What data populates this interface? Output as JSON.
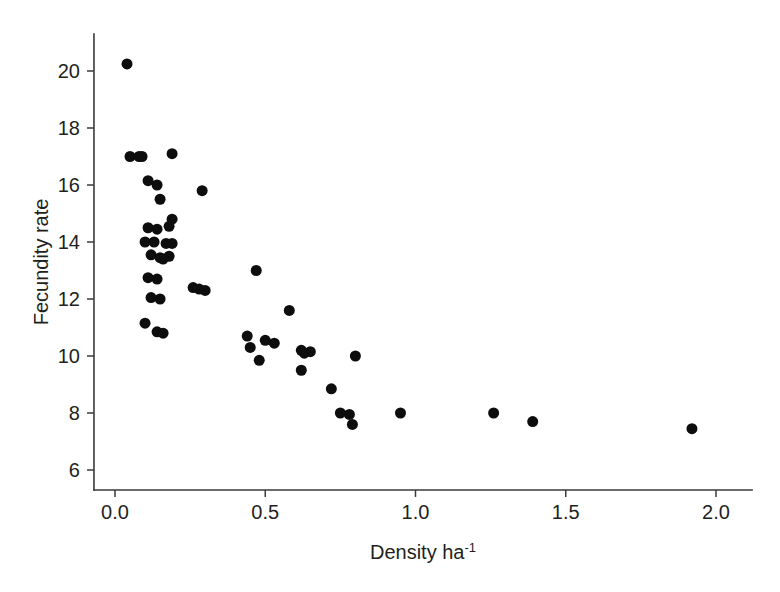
{
  "figure": {
    "background_color": "#ffffff",
    "caption_partial": ""
  },
  "chart_data": {
    "type": "scatter",
    "title": "",
    "subtitle": "",
    "xlabel_text": "Density ha",
    "xlabel_exponent": "-1",
    "xlabel": "Density ha-1",
    "ylabel": "Fecundity rate",
    "xlim": [
      -0.07,
      2.12
    ],
    "ylim": [
      5.3,
      21.3
    ],
    "xticks": [
      0.0,
      0.5,
      1.0,
      1.5,
      2.0
    ],
    "xticklabels": [
      "0.0",
      "0.5",
      "1.0",
      "1.5",
      "2.0"
    ],
    "yticks": [
      6,
      8,
      10,
      12,
      14,
      16,
      18,
      20
    ],
    "yticklabels": [
      "6",
      "8",
      "10",
      "12",
      "14",
      "16",
      "18",
      "20"
    ],
    "grid": false,
    "legend": false,
    "legend_position": "none",
    "marker": "filled-circle",
    "marker_color": "#0d0d0d",
    "marker_size_px": 11,
    "n_points": 54,
    "points": [
      [
        0.04,
        20.25
      ],
      [
        0.05,
        17.0
      ],
      [
        0.08,
        17.0
      ],
      [
        0.09,
        17.0
      ],
      [
        0.19,
        17.1
      ],
      [
        0.11,
        16.15
      ],
      [
        0.14,
        16.0
      ],
      [
        0.29,
        15.8
      ],
      [
        0.15,
        15.5
      ],
      [
        0.11,
        14.5
      ],
      [
        0.14,
        14.45
      ],
      [
        0.18,
        14.55
      ],
      [
        0.19,
        14.8
      ],
      [
        0.1,
        14.0
      ],
      [
        0.13,
        14.0
      ],
      [
        0.17,
        13.95
      ],
      [
        0.19,
        13.95
      ],
      [
        0.12,
        13.55
      ],
      [
        0.15,
        13.45
      ],
      [
        0.18,
        13.5
      ],
      [
        0.16,
        13.4
      ],
      [
        0.47,
        13.0
      ],
      [
        0.11,
        12.75
      ],
      [
        0.14,
        12.7
      ],
      [
        0.26,
        12.4
      ],
      [
        0.28,
        12.35
      ],
      [
        0.3,
        12.3
      ],
      [
        0.12,
        12.05
      ],
      [
        0.15,
        12.0
      ],
      [
        0.58,
        11.6
      ],
      [
        0.1,
        11.15
      ],
      [
        0.14,
        10.85
      ],
      [
        0.16,
        10.8
      ],
      [
        0.44,
        10.7
      ],
      [
        0.5,
        10.55
      ],
      [
        0.45,
        10.3
      ],
      [
        0.53,
        10.45
      ],
      [
        0.62,
        10.2
      ],
      [
        0.65,
        10.15
      ],
      [
        0.63,
        10.1
      ],
      [
        0.8,
        10.0
      ],
      [
        0.48,
        9.85
      ],
      [
        0.62,
        9.5
      ],
      [
        0.72,
        8.85
      ],
      [
        0.75,
        8.0
      ],
      [
        0.78,
        7.95
      ],
      [
        0.79,
        7.6
      ],
      [
        0.95,
        8.0
      ],
      [
        1.26,
        8.0
      ],
      [
        1.39,
        7.7
      ],
      [
        1.92,
        7.45
      ]
    ]
  },
  "axes": {
    "x_axis_name": "density-axis",
    "y_axis_name": "fecundity-axis"
  }
}
